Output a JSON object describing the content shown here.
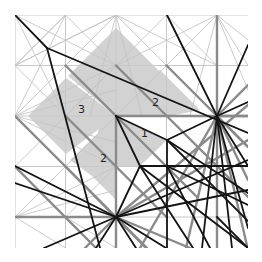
{
  "diagram": {
    "type": "origami-crease-pattern",
    "bounds": {
      "x0": 15,
      "y0": 15,
      "x1": 248,
      "y1": 248
    },
    "colors": {
      "background": "#ffffff",
      "shade": "#d2d2d2",
      "grid": "#c8c8c8",
      "thin": "#c4c4c4",
      "medium": "#8a8a8a",
      "bold": "#141414"
    },
    "labels": [
      {
        "text": "3",
        "x": 78,
        "y": 113
      },
      {
        "text": "2",
        "x": 152,
        "y": 106
      },
      {
        "text": "1",
        "x": 141,
        "y": 137
      },
      {
        "text": "2",
        "x": 100,
        "y": 162
      }
    ],
    "shaded_regions": [
      "116,28 164,76 116,116 68,76",
      "116,28 140,52 116,116",
      "28,116 66,78 116,116 66,154",
      "66,78 116,116 92,116",
      "120,92 160,70 200,110 170,116 116,116",
      "116,116 167,140 140,166 116,166",
      "100,118 116,116 116,200 92,176",
      "116,116 70,160 92,176"
    ],
    "grid_lines": [
      15,
      65.5,
      116,
      166.5,
      217
    ],
    "thin_lines": [
      [
        15,
        15,
        116,
        65.5
      ],
      [
        15,
        15,
        65.5,
        116
      ],
      [
        116,
        15,
        15,
        65.5
      ],
      [
        116,
        15,
        217,
        65.5
      ],
      [
        116,
        15,
        65.5,
        65.5
      ],
      [
        116,
        15,
        166.5,
        65.5
      ],
      [
        217,
        15,
        116,
        65.5
      ],
      [
        217,
        15,
        248,
        40
      ],
      [
        15,
        116,
        65.5,
        65.5
      ],
      [
        15,
        116,
        65.5,
        166.5
      ],
      [
        15,
        116,
        116,
        65.5
      ],
      [
        15,
        116,
        116,
        166.5
      ],
      [
        15,
        116,
        116,
        90
      ],
      [
        15,
        116,
        116,
        142
      ],
      [
        15,
        217,
        65.5,
        166.5
      ],
      [
        15,
        217,
        116,
        166.5
      ],
      [
        15,
        217,
        65.5,
        248
      ],
      [
        15,
        217,
        116,
        190
      ],
      [
        116,
        15,
        90,
        116
      ],
      [
        116,
        15,
        142,
        116
      ],
      [
        217,
        15,
        190,
        116
      ],
      [
        217,
        15,
        248,
        65.5
      ],
      [
        217,
        15,
        166.5,
        65.5
      ],
      [
        217,
        15,
        248,
        90
      ],
      [
        65.5,
        15,
        15,
        65.5
      ],
      [
        65.5,
        15,
        116,
        65.5
      ],
      [
        166.5,
        15,
        116,
        65.5
      ],
      [
        166.5,
        15,
        217,
        65.5
      ],
      [
        65.5,
        65.5,
        116,
        116
      ],
      [
        166.5,
        65.5,
        116,
        116
      ],
      [
        65.5,
        166.5,
        116,
        116
      ],
      [
        65.5,
        116,
        116,
        166.5
      ],
      [
        65.5,
        116,
        116,
        65.5
      ],
      [
        166.5,
        116,
        116,
        65.5
      ],
      [
        15,
        166.5,
        65.5,
        116
      ],
      [
        15,
        166.5,
        65.5,
        217
      ],
      [
        65.5,
        217,
        116,
        166.5
      ],
      [
        65.5,
        217,
        116,
        248
      ],
      [
        15,
        65.5,
        65.5,
        116
      ],
      [
        15,
        65.5,
        65.5,
        15
      ],
      [
        116,
        65.5,
        166.5,
        116
      ],
      [
        116,
        65.5,
        65.5,
        116
      ],
      [
        65.5,
        15,
        15,
        116
      ],
      [
        166.5,
        15,
        217,
        116
      ],
      [
        15,
        166.5,
        116,
        217
      ],
      [
        15,
        65.5,
        116,
        15
      ]
    ],
    "medium_lines": [
      [
        15,
        116,
        116,
        217
      ],
      [
        65.5,
        116,
        166.5,
        217
      ],
      [
        65.5,
        65.5,
        197,
        197
      ],
      [
        116,
        65.5,
        248,
        197
      ],
      [
        166.5,
        65.5,
        248,
        147
      ],
      [
        65.5,
        166.5,
        146,
        248
      ],
      [
        15,
        166.5,
        96,
        248
      ],
      [
        116,
        116,
        116,
        248
      ],
      [
        217,
        116,
        217,
        248
      ],
      [
        217,
        116,
        248,
        116
      ],
      [
        217,
        15,
        217,
        116
      ],
      [
        116,
        116,
        248,
        116
      ],
      [
        15,
        217,
        116,
        217
      ],
      [
        217,
        116,
        248,
        85
      ],
      [
        217,
        116,
        248,
        147
      ],
      [
        217,
        116,
        248,
        180
      ],
      [
        217,
        116,
        186,
        248
      ],
      [
        217,
        116,
        248,
        250
      ],
      [
        116,
        217,
        85,
        248
      ],
      [
        116,
        217,
        147,
        248
      ],
      [
        116,
        217,
        190,
        248
      ],
      [
        116,
        217,
        248,
        140
      ],
      [
        116,
        217,
        248,
        105
      ],
      [
        217,
        116,
        140,
        248
      ]
    ],
    "bold_lines": [
      [
        15,
        15,
        47,
        48
      ],
      [
        47,
        48,
        248,
        133
      ],
      [
        47,
        48,
        100,
        248
      ],
      [
        116,
        116,
        167,
        140
      ],
      [
        167,
        140,
        217,
        116
      ],
      [
        116,
        116,
        140,
        166
      ],
      [
        140,
        166,
        116,
        217
      ],
      [
        167,
        140,
        167,
        248
      ],
      [
        140,
        166,
        248,
        166
      ],
      [
        140,
        166,
        248,
        248
      ],
      [
        167,
        140,
        248,
        221
      ],
      [
        140,
        166,
        193,
        248
      ],
      [
        167,
        140,
        248,
        193
      ],
      [
        217,
        116,
        248,
        102
      ],
      [
        217,
        116,
        248,
        166
      ],
      [
        217,
        116,
        232,
        248
      ],
      [
        217,
        116,
        202,
        248
      ],
      [
        217,
        116,
        167,
        15
      ],
      [
        217,
        116,
        248,
        45
      ],
      [
        217,
        116,
        248,
        228
      ],
      [
        116,
        217,
        15,
        166
      ],
      [
        116,
        217,
        44,
        248
      ],
      [
        116,
        217,
        96,
        248
      ],
      [
        116,
        217,
        136,
        248
      ],
      [
        116,
        217,
        166,
        248
      ],
      [
        116,
        217,
        248,
        160
      ],
      [
        116,
        217,
        248,
        190
      ],
      [
        167,
        166,
        248,
        205
      ],
      [
        167,
        166,
        210,
        248
      ],
      [
        217,
        217,
        248,
        248
      ],
      [
        15,
        183,
        116,
        217
      ]
    ]
  }
}
